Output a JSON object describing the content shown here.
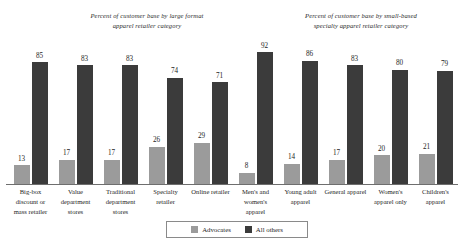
{
  "annotations": {
    "left": "Percent of customer base by large format apparel retailer category",
    "right": "Percent of customer base by small-based specialty apparel retailer category"
  },
  "legend": {
    "advocates_label": "Advocates",
    "all_others_label": "All others",
    "advocates_color": "#9b9b9b",
    "all_others_color": "#3b3b3b"
  },
  "chart_data": {
    "type": "bar",
    "title": "",
    "xlabel": "",
    "ylabel": "",
    "ylim": [
      0,
      100
    ],
    "grid": false,
    "legend_position": "bottom",
    "categories": [
      "Big-box discount or mass retailer",
      "Value department stores",
      "Traditional department stores",
      "Specialty retailer",
      "Online retailer",
      "Men's and women's apparel",
      "Young adult apparel",
      "General apparel",
      "Women's apparel only",
      "Children's apparel"
    ],
    "series": [
      {
        "name": "Advocates",
        "color": "#9b9b9b",
        "values": [
          13,
          17,
          17,
          26,
          29,
          8,
          14,
          17,
          20,
          21
        ]
      },
      {
        "name": "All others",
        "color": "#3b3b3b",
        "values": [
          85,
          83,
          83,
          74,
          71,
          92,
          86,
          83,
          80,
          79
        ]
      }
    ]
  }
}
